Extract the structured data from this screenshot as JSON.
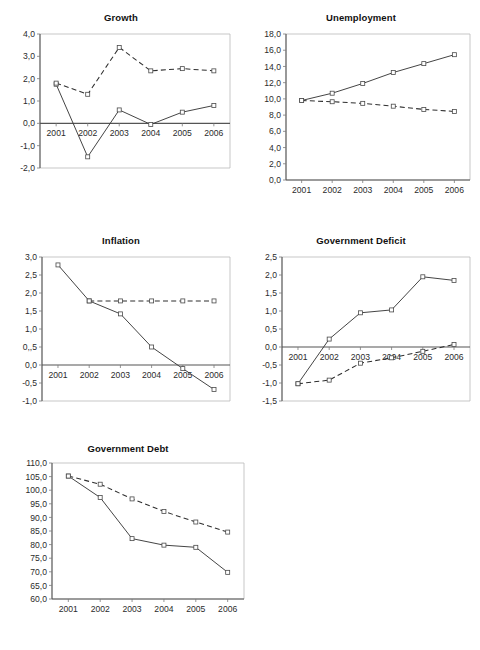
{
  "figure": {
    "background": "#ffffff",
    "series_styles": {
      "solid_label": "solid-line-series",
      "dashed_label": "dashed-line-series",
      "solid_color": "#3a3a3a",
      "dashed_color": "#2e2e2e"
    }
  },
  "chart_data": [
    {
      "id": "growth",
      "type": "line",
      "title": "Growth",
      "xlabel": "",
      "ylabel": "",
      "x": [
        "2001",
        "2002",
        "2003",
        "2004",
        "2005",
        "2006"
      ],
      "xticklabels": [
        "2001",
        "2002",
        "2003",
        "2004",
        "2005",
        "2006"
      ],
      "yticklabels": [
        "4,0",
        "3,0",
        "2,0",
        "1,0",
        "0,0",
        "-1,0",
        "-2,0"
      ],
      "ylim": [
        -2.0,
        4.0
      ],
      "ytick_values": [
        4.0,
        3.0,
        2.0,
        1.0,
        0.0,
        -1.0,
        -2.0
      ],
      "grid": false,
      "zero_line": true,
      "legend": "none",
      "series": [
        {
          "name": "solid",
          "style": "solid",
          "values": [
            1.75,
            -1.5,
            0.6,
            -0.05,
            0.5,
            0.8
          ]
        },
        {
          "name": "dashed",
          "style": "dashed",
          "values": [
            1.8,
            1.3,
            3.4,
            2.35,
            2.45,
            2.35
          ]
        }
      ]
    },
    {
      "id": "unemployment",
      "type": "line",
      "title": "Unemployment",
      "xlabel": "",
      "ylabel": "",
      "x": [
        "2001",
        "2002",
        "2003",
        "2004",
        "2005",
        "2006"
      ],
      "xticklabels": [
        "2001",
        "2002",
        "2003",
        "2004",
        "2005",
        "2006"
      ],
      "yticklabels": [
        "18,0",
        "16,0",
        "14,0",
        "12,0",
        "10,0",
        "8,0",
        "6,0",
        "4,0",
        "2,0",
        "0,0"
      ],
      "ylim": [
        0.0,
        18.0
      ],
      "ytick_values": [
        18.0,
        16.0,
        14.0,
        12.0,
        10.0,
        8.0,
        6.0,
        4.0,
        2.0,
        0.0
      ],
      "grid": false,
      "zero_line": false,
      "legend": "none",
      "series": [
        {
          "name": "solid",
          "style": "solid",
          "values": [
            9.8,
            10.7,
            11.9,
            13.25,
            14.35,
            15.45
          ]
        },
        {
          "name": "dashed",
          "style": "dashed",
          "values": [
            9.8,
            9.65,
            9.45,
            9.1,
            8.7,
            8.45
          ]
        }
      ]
    },
    {
      "id": "inflation",
      "type": "line",
      "title": "Inflation",
      "xlabel": "",
      "ylabel": "",
      "x": [
        "2001",
        "2002",
        "2003",
        "2004",
        "2005",
        "2006"
      ],
      "xticklabels": [
        "2001",
        "2002",
        "2003",
        "2004",
        "2005",
        "2006"
      ],
      "yticklabels": [
        "3,0",
        "2,5",
        "2,0",
        "1,5",
        "1,0",
        "0,,5",
        "0,0",
        "-0,5",
        "-1,0"
      ],
      "ylim": [
        -1.0,
        3.0
      ],
      "ytick_values": [
        3.0,
        2.5,
        2.0,
        1.5,
        1.0,
        0.5,
        0.0,
        -0.5,
        -1.0
      ],
      "grid": false,
      "zero_line": true,
      "legend": "none",
      "series": [
        {
          "name": "solid",
          "style": "solid",
          "values": [
            2.78,
            1.78,
            1.42,
            0.5,
            -0.1,
            -0.68
          ]
        },
        {
          "name": "dashed",
          "style": "dashed",
          "values": [
            null,
            1.78,
            1.78,
            1.78,
            1.78,
            1.78
          ]
        }
      ]
    },
    {
      "id": "government-deficit",
      "type": "line",
      "title": "Government Deficit",
      "xlabel": "",
      "ylabel": "",
      "x": [
        "2001",
        "2002",
        "2003",
        "2004",
        "2005",
        "2006"
      ],
      "xticklabels": [
        "2001",
        "2002",
        "2003",
        "2004",
        "2005",
        "2006"
      ],
      "yticklabels": [
        "2,5",
        "2,0",
        "1,5",
        "1,0",
        "0,5",
        "0,0",
        "-0,5",
        "-1,0",
        "-1,5"
      ],
      "ylim": [
        -1.5,
        2.5
      ],
      "ytick_values": [
        2.5,
        2.0,
        1.5,
        1.0,
        0.5,
        0.0,
        -0.5,
        -1.0,
        -1.5
      ],
      "grid": false,
      "zero_line": true,
      "legend": "none",
      "series": [
        {
          "name": "solid",
          "style": "solid",
          "values": [
            -1.02,
            0.22,
            0.95,
            1.03,
            1.95,
            1.85
          ]
        },
        {
          "name": "dashed",
          "style": "dashed",
          "values": [
            -1.02,
            -0.92,
            -0.45,
            -0.3,
            -0.12,
            0.07
          ]
        }
      ]
    },
    {
      "id": "government-debt",
      "type": "line",
      "title": "Government Debt",
      "xlabel": "",
      "ylabel": "",
      "x": [
        "2001",
        "2002",
        "2003",
        "2004",
        "2005",
        "2006"
      ],
      "xticklabels": [
        "2001",
        "2002",
        "2003",
        "2004",
        "2005",
        "2006"
      ],
      "yticklabels": [
        "110,0",
        "105,0",
        "100,0",
        "95,0",
        "90,0",
        "85,0",
        "80,0",
        "75,0",
        "70,0",
        "65,0",
        "60,0"
      ],
      "ylim": [
        60.0,
        110.0
      ],
      "ytick_values": [
        110.0,
        105.0,
        100.0,
        95.0,
        90.0,
        85.0,
        80.0,
        75.0,
        70.0,
        65.0,
        60.0
      ],
      "grid": false,
      "zero_line": false,
      "legend": "none",
      "series": [
        {
          "name": "solid",
          "style": "solid",
          "values": [
            105.2,
            97.3,
            82.2,
            79.8,
            79.0,
            69.8
          ]
        },
        {
          "name": "dashed",
          "style": "dashed",
          "values": [
            105.2,
            102.2,
            96.8,
            92.2,
            88.3,
            84.6
          ]
        }
      ]
    }
  ]
}
